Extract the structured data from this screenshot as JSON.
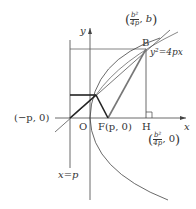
{
  "diagram": {
    "axes": {
      "x_label": "x",
      "y_label": "y",
      "origin_label": "O"
    },
    "points": {
      "B": {
        "label": "B",
        "coord_num": "b²",
        "coord_den": "4p",
        "coord_y": "b"
      },
      "F": {
        "label": "F(p, 0)"
      },
      "H": {
        "label": "H",
        "coord_num": "b²",
        "coord_den": "4p",
        "coord_y": "0"
      },
      "neg_p": {
        "label": "(−p, 0)"
      }
    },
    "curve_label": "y²=4px",
    "directrix_label": "x=p"
  }
}
